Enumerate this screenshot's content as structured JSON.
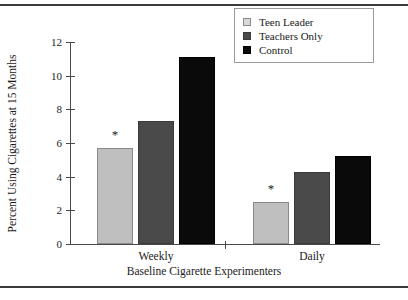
{
  "chart_data": {
    "type": "bar",
    "title": "",
    "xlabel": "Baseline Cigarette Experimenters",
    "ylabel": "Percent Using Cigarettes at 15 Months",
    "categories": [
      "Weekly",
      "Daily"
    ],
    "series": [
      {
        "name": "Teen Leader",
        "color": "#bfbfbf",
        "values": [
          5.7,
          2.5
        ]
      },
      {
        "name": "Teachers Only",
        "color": "#4a4a4a",
        "values": [
          7.3,
          4.3
        ]
      },
      {
        "name": "Control",
        "color": "#0a0a0a",
        "values": [
          11.1,
          5.2
        ]
      }
    ],
    "ylim": [
      0,
      12
    ],
    "yticks": [
      0,
      2,
      4,
      6,
      8,
      10,
      12
    ],
    "ytick_labels": [
      "0",
      "2",
      "4",
      "6",
      "8",
      "10",
      "12"
    ],
    "grid": false,
    "legend_position": "top-right",
    "annotations": [
      {
        "label": "*",
        "category": "Weekly",
        "series": "Teen Leader"
      },
      {
        "label": "*",
        "category": "Daily",
        "series": "Teen Leader"
      }
    ]
  },
  "legend": {
    "items": [
      {
        "label": "Teen Leader"
      },
      {
        "label": "Teachers Only"
      },
      {
        "label": "Control"
      }
    ]
  },
  "axes": {
    "x_title": "Baseline Cigarette Experimenters",
    "y_title": "Percent Using Cigarettes at 15 Months",
    "x_categories": [
      "Weekly",
      "Daily"
    ],
    "y_labels": [
      "0",
      "2",
      "4",
      "6",
      "8",
      "10",
      "12"
    ]
  },
  "marks": {
    "asterisk": "*"
  }
}
